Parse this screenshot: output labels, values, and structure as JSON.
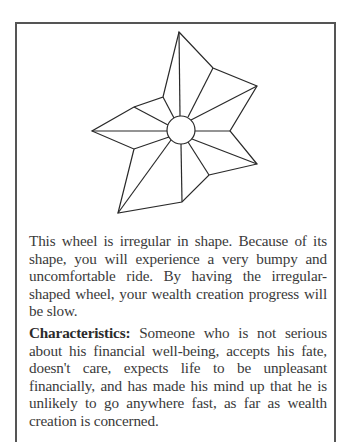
{
  "figure": {
    "description": "irregular-shaped wheel",
    "stroke_color": "#2a2a2a",
    "outer_polygon": [
      [
        179,
        32
      ],
      [
        213,
        68
      ],
      [
        257,
        86
      ],
      [
        230,
        131
      ],
      [
        257,
        164
      ],
      [
        209,
        175
      ],
      [
        182,
        202
      ],
      [
        118,
        213
      ],
      [
        134,
        149
      ],
      [
        92,
        131
      ],
      [
        134,
        107
      ],
      [
        163,
        97
      ]
    ],
    "hub": {
      "cx": 181,
      "cy": 130,
      "r": 14
    }
  },
  "text": {
    "paragraph1": "This wheel is irregular in shape. Because of its shape, you will experience a very bumpy and uncomfortable ride. By having the irregular-shaped wheel, your wealth creation progress will be slow.",
    "characteristics_label": "Characteristics:",
    "characteristics_body": " Someone who is not serious about his financial well-being, accepts his fate, doesn't care, expects life to be unpleasant financially, and has made his mind up that he is unlikely to go anywhere fast, as far as wealth creation is concerned."
  }
}
